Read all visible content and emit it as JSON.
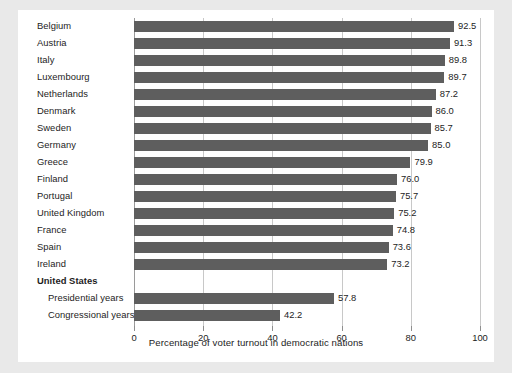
{
  "chart_data": {
    "type": "bar",
    "orientation": "horizontal",
    "title": "",
    "xlabel": "Percentage of voter turnout in democratic nations",
    "ylabel": "",
    "xlim": [
      0,
      100
    ],
    "xticks": [
      0,
      20,
      40,
      60,
      80,
      100
    ],
    "xtick_labels": [
      "0",
      "20",
      "40",
      "60",
      "80",
      "100"
    ],
    "grid": true,
    "legend": false,
    "bar_color": "#5e5e5e",
    "categories": [
      "Belgium",
      "Austria",
      "Italy",
      "Luxembourg",
      "Netherlands",
      "Denmark",
      "Sweden",
      "Germany",
      "Greece",
      "Finland",
      "Portugal",
      "United Kingdom",
      "France",
      "Spain",
      "Ireland",
      "United States",
      "Presidential years",
      "Congressional years"
    ],
    "values": [
      92.5,
      91.3,
      89.8,
      89.7,
      87.2,
      86.0,
      85.7,
      85.0,
      79.9,
      76.0,
      75.7,
      75.2,
      74.8,
      73.6,
      73.2,
      null,
      57.8,
      42.2
    ],
    "value_labels": [
      "92.5",
      "91.3",
      "89.8",
      "89.7",
      "87.2",
      "86.0",
      "85.7",
      "85.0",
      "79.9",
      "76.0",
      "75.7",
      "75.2",
      "74.8",
      "73.6",
      "73.2",
      "",
      "57.8",
      "42.2"
    ],
    "rows": [
      {
        "label": "Belgium",
        "value": 92.5,
        "label_text": "92.5",
        "style": "normal"
      },
      {
        "label": "Austria",
        "value": 91.3,
        "label_text": "91.3",
        "style": "normal"
      },
      {
        "label": "Italy",
        "value": 89.8,
        "label_text": "89.8",
        "style": "normal"
      },
      {
        "label": "Luxembourg",
        "value": 89.7,
        "label_text": "89.7",
        "style": "normal"
      },
      {
        "label": "Netherlands",
        "value": 87.2,
        "label_text": "87.2",
        "style": "normal"
      },
      {
        "label": "Denmark",
        "value": 86.0,
        "label_text": "86.0",
        "style": "normal"
      },
      {
        "label": "Sweden",
        "value": 85.7,
        "label_text": "85.7",
        "style": "normal"
      },
      {
        "label": "Germany",
        "value": 85.0,
        "label_text": "85.0",
        "style": "normal"
      },
      {
        "label": "Greece",
        "value": 79.9,
        "label_text": "79.9",
        "style": "normal"
      },
      {
        "label": "Finland",
        "value": 76.0,
        "label_text": "76.0",
        "style": "normal"
      },
      {
        "label": "Portugal",
        "value": 75.7,
        "label_text": "75.7",
        "style": "normal"
      },
      {
        "label": "United Kingdom",
        "value": 75.2,
        "label_text": "75.2",
        "style": "normal"
      },
      {
        "label": "France",
        "value": 74.8,
        "label_text": "74.8",
        "style": "normal"
      },
      {
        "label": "Spain",
        "value": 73.6,
        "label_text": "73.6",
        "style": "normal"
      },
      {
        "label": "Ireland",
        "value": 73.2,
        "label_text": "73.2",
        "style": "normal"
      },
      {
        "label": "United States",
        "value": null,
        "label_text": "",
        "style": "header"
      },
      {
        "label": "Presidential years",
        "value": 57.8,
        "label_text": "57.8",
        "style": "indent"
      },
      {
        "label": "Congressional years",
        "value": 42.2,
        "label_text": "42.2",
        "style": "indent"
      }
    ]
  }
}
